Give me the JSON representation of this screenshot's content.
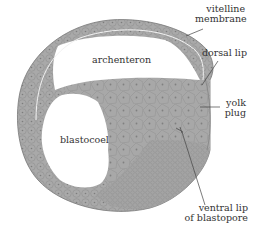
{
  "diagram": {
    "colors": {
      "tissue": "#a7a7a7",
      "tissue_dark": "#8e8e8e",
      "cell_line": "#7a7a7a",
      "cavity": "#ffffff",
      "text": "#333333",
      "leader": "#444444"
    },
    "labels": {
      "vitelline_line1": "vitelline",
      "vitelline_line2": "membrane",
      "dorsal_lip": "dorsal lip",
      "archenteron": "archenteron",
      "yolk_line1": "yolk",
      "yolk_line2": "plug",
      "blastocoel": "blastocoel",
      "ventral_line1": "ventral lip",
      "ventral_line2": "of blastopore"
    }
  }
}
